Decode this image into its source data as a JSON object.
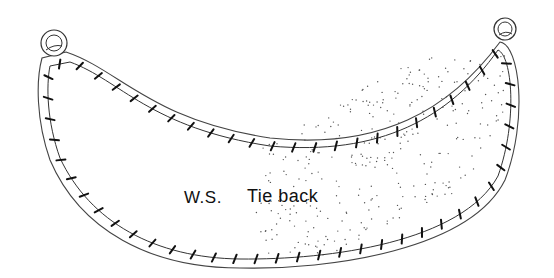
{
  "diagram": {
    "type": "sewing-pattern-illustration",
    "subject": "tie back",
    "labels": {
      "side": "W.S.",
      "name": "Tie back"
    },
    "elements": {
      "left_ring": "ring-icon",
      "right_ring": "ring-icon",
      "outline": "double-outline crescent",
      "stitching": "cross-stitch marks along inner seam line",
      "shading": "stippled dots on right-hand portion"
    },
    "colors": {
      "ink": "#111111",
      "outline": "#444444",
      "background": "#ffffff"
    }
  }
}
